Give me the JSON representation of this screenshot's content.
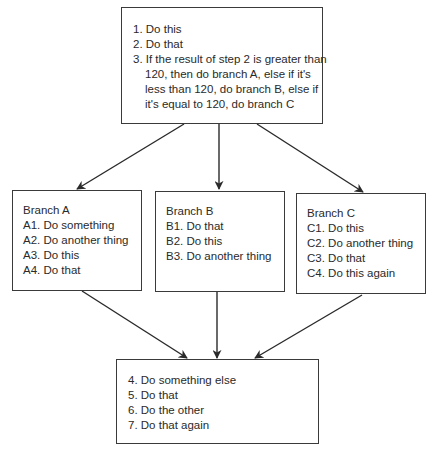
{
  "diagram": {
    "type": "flowchart",
    "start_box": {
      "lines": [
        "1. Do this",
        "2. Do that",
        "3. If the result of step 2 is greater than",
        "120, then do branch A, else if it's",
        "less than 120, do branch B, else if",
        "it's equal to 120, do branch C"
      ]
    },
    "branch_a": {
      "title": "Branch A",
      "steps": [
        "A1. Do something",
        "A2. Do another thing",
        "A3. Do this",
        "A4. Do that"
      ]
    },
    "branch_b": {
      "title": "Branch B",
      "steps": [
        "B1. Do that",
        "B2. Do this",
        "B3. Do another thing"
      ]
    },
    "branch_c": {
      "title": "Branch C",
      "steps": [
        "C1. Do this",
        "C2. Do another thing",
        "C3. Do that",
        "C4. Do this again"
      ]
    },
    "end_box": {
      "lines": [
        "4. Do something else",
        "5. Do that",
        "6. Do the other",
        "7. Do that again"
      ]
    },
    "edges": [
      {
        "from": "start_box",
        "to": "branch_a"
      },
      {
        "from": "start_box",
        "to": "branch_b"
      },
      {
        "from": "start_box",
        "to": "branch_c"
      },
      {
        "from": "branch_a",
        "to": "end_box"
      },
      {
        "from": "branch_b",
        "to": "end_box"
      },
      {
        "from": "branch_c",
        "to": "end_box"
      }
    ],
    "colors": {
      "stroke": "#2a2a2a",
      "text": "#2a2a2a",
      "background": "#ffffff"
    }
  }
}
